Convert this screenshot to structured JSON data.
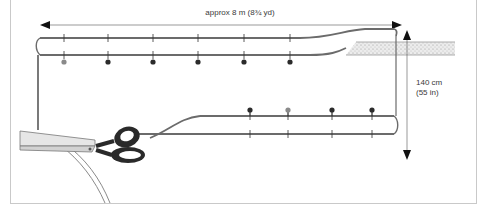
{
  "diagram": {
    "width_label": "approx 8 m (8¾ yd)",
    "height_label_line1": "140 cm",
    "height_label_line2": "(55 in)",
    "colors": {
      "frame": "#c9c9c9",
      "fabric_edge": "#6b6b6b",
      "arrow": "#1a1a1a",
      "pin_dark": "#2b2b2b",
      "pin_light": "#8a8a8a",
      "table": "#d8d8d8",
      "scissors_handle": "#2a2a2a"
    },
    "top_pins": [
      {
        "x": 64,
        "shade": "light"
      },
      {
        "x": 108,
        "shade": "dark"
      },
      {
        "x": 153,
        "shade": "dark"
      },
      {
        "x": 198,
        "shade": "dark"
      },
      {
        "x": 244,
        "shade": "dark"
      },
      {
        "x": 290,
        "shade": "dark"
      }
    ],
    "bottom_pins": [
      {
        "x": 250,
        "shade": "dark"
      },
      {
        "x": 288,
        "shade": "light"
      },
      {
        "x": 332,
        "shade": "dark"
      },
      {
        "x": 372,
        "shade": "dark"
      }
    ]
  }
}
